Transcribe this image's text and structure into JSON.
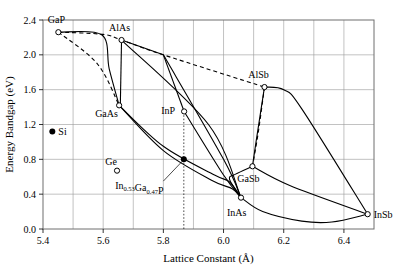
{
  "chart_data": {
    "type": "scatter",
    "title": "",
    "xlabel": "Lattice Constant (Å)",
    "ylabel": "Energy Bandgap (eV)",
    "xlim": [
      5.4,
      6.5
    ],
    "ylim": [
      0.0,
      2.4
    ],
    "xticks": [
      5.4,
      5.6,
      5.8,
      6.0,
      6.2,
      6.4
    ],
    "xtick_labels": [
      "5.4",
      "5.6",
      "5.8",
      "6.0",
      "6.2",
      "6.4"
    ],
    "x_minor_gridlines": [
      5.5,
      5.7,
      5.9,
      6.1,
      6.3
    ],
    "yticks": [
      0.0,
      0.4,
      0.8,
      1.2,
      1.6,
      2.0,
      2.4
    ],
    "ytick_labels": [
      "0.0",
      "0.4",
      "0.8",
      "1.2",
      "1.6",
      "2.0",
      "2.4"
    ],
    "grid": true,
    "legend": "none",
    "points": [
      {
        "name": "GaP",
        "x": 5.451,
        "y": 2.26,
        "marker": "open",
        "label": "GaP",
        "label_dx": -2,
        "label_dy": -9
      },
      {
        "name": "AlAs",
        "x": 5.661,
        "y": 2.17,
        "marker": "open",
        "label": "AlAs",
        "label_dx": -2,
        "label_dy": -9
      },
      {
        "name": "GaAs",
        "x": 5.653,
        "y": 1.42,
        "marker": "open",
        "label": "GaAs",
        "label_dx": -24,
        "label_dy": 12
      },
      {
        "name": "Si",
        "x": 5.431,
        "y": 1.12,
        "marker": "filled",
        "label": "Si",
        "label_dx": 6,
        "label_dy": 4
      },
      {
        "name": "Ge",
        "x": 5.646,
        "y": 0.67,
        "marker": "open",
        "label": "Ge",
        "label_dx": -6,
        "label_dy": -6
      },
      {
        "name": "InP",
        "x": 5.869,
        "y": 1.35,
        "marker": "open",
        "label": "InP",
        "label_dx": -23,
        "label_dy": 3
      },
      {
        "name": "AlSb",
        "x": 6.136,
        "y": 1.63,
        "marker": "open",
        "label": "AlSb",
        "label_dx": -6,
        "label_dy": -9
      },
      {
        "name": "GaSb",
        "x": 6.096,
        "y": 0.72,
        "marker": "open",
        "label": "GaSb",
        "label_dx": -4,
        "label_dy": 16
      },
      {
        "name": "InAs",
        "x": 6.058,
        "y": 0.36,
        "marker": "open",
        "label": "InAs",
        "label_dx": -14,
        "label_dy": 18
      },
      {
        "name": "InSb",
        "x": 6.479,
        "y": 0.17,
        "marker": "open",
        "label": "InSb",
        "label_dx": 6,
        "label_dy": 4
      },
      {
        "name": "InGaP",
        "x": 5.868,
        "y": 0.8,
        "marker": "filled",
        "label": "",
        "label_dx": 0,
        "label_dy": 0
      }
    ],
    "annotations": [
      {
        "name": "ingap-annotation",
        "text_parts": [
          {
            "t": "In",
            "sub": false
          },
          {
            "t": "0.53",
            "sub": true
          },
          {
            "t": "Ga",
            "sub": false
          },
          {
            "t": "0.47",
            "sub": true
          },
          {
            "t": "P",
            "sub": false
          }
        ],
        "text_plain": "In0.53Ga0.47P",
        "x": 5.72,
        "y": 0.46
      }
    ],
    "vertical_marker": {
      "name": "ingap-vline",
      "x": 5.868,
      "y_from": 0.0,
      "y_to": 1.35
    },
    "series": [
      {
        "name": "GaP-AlAs-dashed",
        "style": "dashed",
        "points": [
          [
            5.451,
            2.26
          ],
          [
            5.6,
            2.235
          ],
          [
            5.661,
            2.17
          ],
          [
            5.8,
            2.0
          ],
          [
            6.136,
            1.63
          ]
        ]
      },
      {
        "name": "GaP-GaAs-dashed",
        "style": "dashed",
        "points": [
          [
            5.451,
            2.26
          ],
          [
            5.58,
            1.9
          ],
          [
            5.653,
            1.42
          ]
        ]
      },
      {
        "name": "GaP-GaAs-solid",
        "style": "solid",
        "points": [
          [
            5.451,
            2.26
          ],
          [
            5.595,
            2.23
          ],
          [
            5.62,
            1.84
          ],
          [
            5.653,
            1.42
          ]
        ]
      },
      {
        "name": "AlAs-GaAs-solid",
        "style": "solid",
        "points": [
          [
            5.661,
            2.17
          ],
          [
            5.657,
            1.42
          ]
        ]
      },
      {
        "name": "AlAs-InP-solid",
        "style": "solid",
        "points": [
          [
            5.661,
            2.17
          ],
          [
            5.8,
            2.0
          ]
        ]
      },
      {
        "name": "AlAs-InAs-solid",
        "style": "solid",
        "points": [
          [
            5.661,
            2.17
          ],
          [
            5.95,
            1.2
          ],
          [
            6.058,
            0.36
          ]
        ]
      },
      {
        "name": "vertex-InP-solid",
        "style": "solid",
        "points": [
          [
            5.8,
            2.0
          ],
          [
            5.869,
            1.35
          ]
        ]
      },
      {
        "name": "vertex-InAs-solid",
        "style": "solid",
        "points": [
          [
            5.8,
            2.0
          ],
          [
            6.0,
            0.8
          ],
          [
            6.058,
            0.36
          ]
        ]
      },
      {
        "name": "InP-InAs-solid",
        "style": "solid",
        "points": [
          [
            5.869,
            1.35
          ],
          [
            6.0,
            0.62
          ],
          [
            6.058,
            0.36
          ]
        ]
      },
      {
        "name": "GaAs-InAs-upper",
        "style": "solid",
        "points": [
          [
            5.653,
            1.42
          ],
          [
            5.8,
            0.95
          ],
          [
            5.97,
            0.62
          ],
          [
            6.02,
            0.54
          ],
          [
            6.058,
            0.36
          ]
        ]
      },
      {
        "name": "GaAs-InAs-lower",
        "style": "solid",
        "points": [
          [
            5.653,
            1.42
          ],
          [
            5.8,
            0.9
          ],
          [
            5.96,
            0.56
          ],
          [
            6.03,
            0.46
          ],
          [
            6.058,
            0.36
          ]
        ]
      },
      {
        "name": "AlSb-GaSb-dashed",
        "style": "dashed",
        "points": [
          [
            6.136,
            1.63
          ],
          [
            6.115,
            1.1
          ],
          [
            6.096,
            0.72
          ]
        ]
      },
      {
        "name": "AlSb-GaSb-solid",
        "style": "solid",
        "points": [
          [
            6.136,
            1.63
          ],
          [
            6.108,
            1.0
          ],
          [
            6.096,
            0.72
          ]
        ]
      },
      {
        "name": "AlSb-InSb-solid",
        "style": "solid",
        "points": [
          [
            6.136,
            1.63
          ],
          [
            6.2,
            1.6
          ],
          [
            6.26,
            1.38
          ],
          [
            6.479,
            0.17
          ]
        ]
      },
      {
        "name": "GaSb-InSb-solid",
        "style": "solid",
        "points": [
          [
            6.096,
            0.72
          ],
          [
            6.22,
            0.5
          ],
          [
            6.479,
            0.17
          ]
        ]
      },
      {
        "name": "InAs-InSb-solid",
        "style": "solid",
        "points": [
          [
            6.058,
            0.36
          ],
          [
            6.13,
            0.2
          ],
          [
            6.26,
            0.09
          ],
          [
            6.36,
            0.08
          ],
          [
            6.479,
            0.17
          ]
        ]
      },
      {
        "name": "InAs-GaSb-curve",
        "style": "solid",
        "points": [
          [
            6.058,
            0.36
          ],
          [
            6.02,
            0.57
          ],
          [
            6.04,
            0.63
          ],
          [
            6.096,
            0.72
          ]
        ]
      }
    ]
  }
}
